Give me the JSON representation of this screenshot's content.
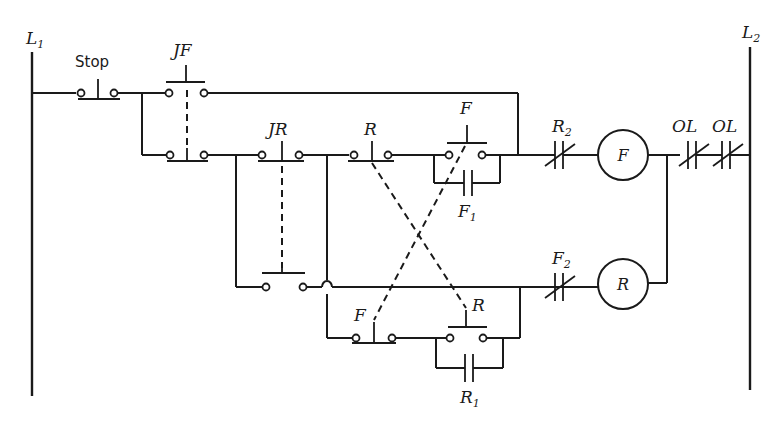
{
  "diagram": {
    "type": "ladder-diagram",
    "rails": {
      "left": {
        "label": "L",
        "sub": "1"
      },
      "right": {
        "label": "L",
        "sub": "2"
      }
    },
    "contacts": {
      "stop": {
        "label": "Stop",
        "kind": "pushbutton-NC"
      },
      "jog_forward": {
        "label": "JF",
        "kind": "pushbutton-NO/NC pair"
      },
      "jog_reverse": {
        "label": "JR",
        "kind": "pushbutton-NO/NC pair"
      },
      "r_pushbutton": {
        "label": "R",
        "kind": "pushbutton-NC"
      },
      "f_pushbutton": {
        "label": "F",
        "kind": "pushbutton-NO"
      },
      "f1_seal": {
        "label": "F",
        "sub": "1",
        "kind": "contact-NO"
      },
      "r2_interlock": {
        "label": "R",
        "sub": "2",
        "kind": "contact-NC"
      },
      "f2_interlock": {
        "label": "F",
        "sub": "2",
        "kind": "contact-NC"
      },
      "f_pushbutton_lower": {
        "label": "F",
        "kind": "pushbutton-NC"
      },
      "r_pushbutton_lower": {
        "label": "R",
        "kind": "pushbutton-NO"
      },
      "r1_seal": {
        "label": "R",
        "sub": "1",
        "kind": "contact-NO"
      },
      "overload_1": {
        "label": "OL",
        "kind": "contact-NC"
      },
      "overload_2": {
        "label": "OL",
        "kind": "contact-NC"
      }
    },
    "coils": {
      "forward": {
        "label": "F"
      },
      "reverse": {
        "label": "R"
      }
    }
  }
}
